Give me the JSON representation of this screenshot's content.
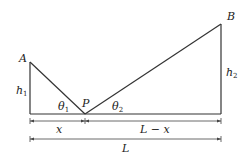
{
  "diagram": {
    "points": {
      "A": {
        "label": "A"
      },
      "B": {
        "label": "B"
      },
      "P": {
        "label": "P"
      }
    },
    "heights": {
      "h1": {
        "base": "h",
        "sub": "1"
      },
      "h2": {
        "base": "h",
        "sub": "2"
      }
    },
    "angles": {
      "theta1": {
        "base": "θ",
        "sub": "1"
      },
      "theta2": {
        "base": "θ",
        "sub": "2"
      }
    },
    "dimensions": {
      "x": "x",
      "L_minus_x": "L − x",
      "L": "L"
    },
    "colors": {
      "line": "#333333",
      "text": "#222222"
    }
  }
}
